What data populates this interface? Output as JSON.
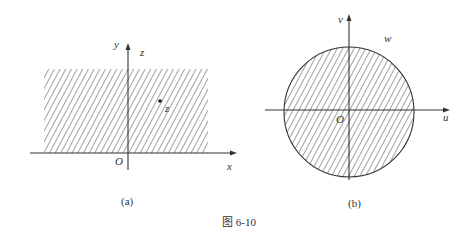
{
  "figure": {
    "caption": "图 6-10",
    "colors": {
      "ink": "#333333",
      "hatch": "#444444",
      "background": "#ffffff"
    }
  },
  "panel_a": {
    "sublabel": "(a)",
    "axes": {
      "x_label": "x",
      "y_label": "y",
      "origin_label": "O"
    },
    "region_label": "z",
    "point_label": "z",
    "region": "upper half-plane (hatched)"
  },
  "panel_b": {
    "sublabel": "(b)",
    "axes": {
      "x_label": "u",
      "y_label": "v",
      "origin_label": "O"
    },
    "region_label": "w",
    "region": "disk centered at origin (hatched)"
  }
}
